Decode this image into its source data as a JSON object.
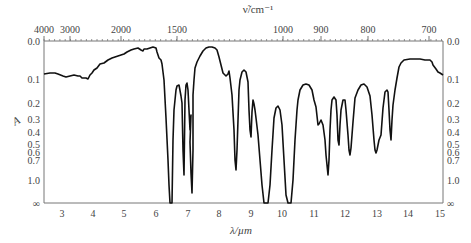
{
  "chart_data": {
    "type": "line",
    "title": "",
    "xlabel": "λ/µm",
    "x2label": "ν̃/cm⁻¹",
    "ylabel": "A",
    "xlim": [
      2.5,
      15
    ],
    "x_ticks": [
      3,
      4,
      5,
      6,
      7,
      8,
      9,
      10,
      11,
      12,
      13,
      14,
      15
    ],
    "x2_ticks": [
      "4000",
      "3000",
      "2000",
      "1500",
      "1000",
      "900",
      "800",
      "700"
    ],
    "y_ticks_left": [
      "0.0",
      "0.1",
      "0.2",
      "0.3",
      "0.4",
      "0.5",
      "0.6",
      "0.7",
      "1.0",
      "∞"
    ],
    "y_ticks_right": [
      "0.0",
      "0.1",
      "0.2",
      "0.3",
      "0.4",
      "0.5",
      "0.6",
      "0.7",
      "1.0",
      "∞"
    ],
    "grid": false,
    "legend": null,
    "series": [
      {
        "name": "IR absorbance spectrum",
        "x": [
          2.5,
          2.8,
          3.0,
          3.2,
          3.3,
          3.4,
          3.5,
          3.8,
          4.0,
          4.3,
          4.6,
          5.0,
          5.1,
          5.2,
          5.4,
          5.5,
          5.6,
          5.68,
          5.75,
          5.85,
          5.95,
          6.05,
          6.1,
          6.2,
          6.3,
          6.5,
          6.8,
          7.0,
          7.1,
          7.2,
          7.25,
          7.4,
          7.6,
          7.7,
          7.75,
          7.85,
          8.0,
          8.2,
          8.35,
          8.5,
          8.65,
          8.8,
          8.9,
          9.2,
          9.4,
          9.55,
          9.7,
          9.8,
          10.0,
          10.1,
          10.25,
          10.4,
          10.55,
          10.9,
          11.1,
          11.3,
          11.45,
          11.55,
          11.7,
          11.9,
          12.5,
          13.0,
          13.5,
          13.8,
          14.2,
          14.6,
          15.0
        ],
        "y": [
          0.15,
          0.16,
          0.17,
          0.2,
          0.18,
          0.16,
          0.13,
          0.1,
          0.09,
          0.08,
          0.075,
          0.07,
          0.08,
          0.075,
          0.08,
          0.12,
          0.3,
          5.0,
          0.25,
          0.12,
          0.12,
          0.6,
          0.12,
          0.1,
          1.2,
          0.08,
          0.06,
          0.12,
          0.14,
          0.7,
          0.12,
          0.08,
          0.15,
          0.55,
          0.15,
          0.2,
          1.2,
          5.0,
          0.25,
          0.25,
          5.0,
          0.2,
          0.1,
          0.08,
          0.2,
          0.8,
          0.15,
          0.13,
          0.45,
          0.14,
          0.5,
          0.09,
          0.08,
          0.5,
          0.16,
          0.4,
          0.06,
          0.04,
          0.04,
          0.04,
          0.04,
          0.045,
          0.05,
          0.07,
          0.085,
          0.09,
          0.1
        ]
      }
    ]
  },
  "plot": {
    "left": 44,
    "right": 443,
    "top": 41,
    "bottom": 203,
    "x_label": "λ/µm",
    "top_label": "ν̃/cm⁻¹",
    "y_label": "A",
    "curve_points": "44,74 50,73 55,73 58,74 63,76 66,77 70,76 74,75 78,76 80,76 82,78 84,78 86,78 88,79 90,75 92,73 94,70 97,68 100,64 104,63 108,60 112,58 115,57 118,56 121,55 124,54 127,52 131,50 134,49 138,48 141,50 143,51 144,49 147,49 150,48 153,47 156,48 157,52 159,58 161,60 162,64 164,80 166,118 168,160 169,185 170,203 172,203 173,140 174,110 176,90 177,86 179,85 181,96 182,103 183,150 184,175 185,100 186,85 187,83 188,90 189,110 190,130 191,115 190,142 191,173 192,193 193,150 193,95 194,80 195,68 197,62 200,56 203,51 206,48 209,47 212,47 215,48 217,50 219,57 221,65 223,73 226,76 228,74 229,71 230,78 232,95 234,130 235,160 236,170 237,150 238,120 239,90 240,80 242,72 244,70 246,72 248,82 249,110 250,130 251,137 252,112 253,100 254,104 255,110 256,118 258,135 260,160 262,185 264,203 268,203 270,185 272,150 274,118 276,108 278,106 280,110 282,125 284,160 286,195 288,203 291,203 293,180 295,140 297,110 298,100 300,90 303,85 306,84 309,85 312,90 314,100 316,107 318,125 319,124 321,120 323,125 325,140 326,155 327,165 328,175 329,160 330,130 331,110 332,100 334,97 336,100 337,115 338,140 339,145 340,125 341,110 343,100 345,100 346,110 348,135 349,150 350,155 351,148 353,122 355,98 358,90 361,85 364,84 367,87 370,96 372,115 374,140 375,150 376,153 377,150 379,140 381,135 383,108 385,92 387,90 388,92 389,110 390,130 391,140 392,120 393,105 395,90 397,78 399,67 401,63 404,60 410,59 420,59 425,60 430,60 432,62 433,65 436,69 438,72 440,73 443,75"
  },
  "axis_ticks": {
    "bottom": [
      {
        "label": "3",
        "x": 62
      },
      {
        "label": "4",
        "x": 93
      },
      {
        "label": "5",
        "x": 124
      },
      {
        "label": "6",
        "x": 156
      },
      {
        "label": "7",
        "x": 188
      },
      {
        "label": "8",
        "x": 219
      },
      {
        "label": "9",
        "x": 251
      },
      {
        "label": "10",
        "x": 282
      },
      {
        "label": "11",
        "x": 314
      },
      {
        "label": "12",
        "x": 345
      },
      {
        "label": "13",
        "x": 377
      },
      {
        "label": "14",
        "x": 408
      },
      {
        "label": "15",
        "x": 440
      }
    ],
    "top": [
      {
        "label": "4000",
        "x": 44
      },
      {
        "label": "3000",
        "x": 70
      },
      {
        "label": "2000",
        "x": 121
      },
      {
        "label": "1500",
        "x": 177
      },
      {
        "label": "1000",
        "x": 283
      },
      {
        "label": "900",
        "x": 321
      },
      {
        "label": "800",
        "x": 368
      },
      {
        "label": "700",
        "x": 429
      }
    ],
    "left": [
      {
        "label": "0.0",
        "y": 41
      },
      {
        "label": "0.1",
        "y": 79
      },
      {
        "label": "0.2",
        "y": 103
      },
      {
        "label": "0.3",
        "y": 119
      },
      {
        "label": "0.4",
        "y": 132
      },
      {
        "label": "0.5",
        "y": 144
      },
      {
        "label": "0.6",
        "y": 152
      },
      {
        "label": "0.7",
        "y": 160
      },
      {
        "label": "1.0",
        "y": 180
      },
      {
        "label": "∞",
        "y": 203
      }
    ]
  }
}
